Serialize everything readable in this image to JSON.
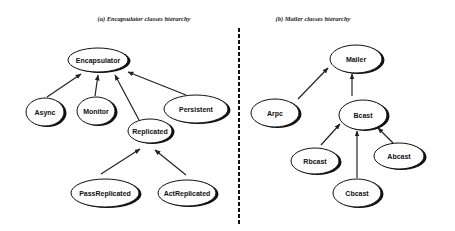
{
  "diagrams": [
    {
      "title": "(a) Encapsulator classes hierarchy",
      "title_pos": [
        144,
        21
      ],
      "nodes": [
        {
          "id": "encapsulator",
          "label": "Encapsulator",
          "cx": 98,
          "cy": 60,
          "rx": 30,
          "ry": 12
        },
        {
          "id": "async",
          "label": "Async",
          "cx": 45,
          "cy": 112,
          "rx": 19,
          "ry": 14
        },
        {
          "id": "monitor",
          "label": "Monitor",
          "cx": 96,
          "cy": 111,
          "rx": 19,
          "ry": 14
        },
        {
          "id": "persistent",
          "label": "Persistent",
          "cx": 196,
          "cy": 109,
          "rx": 32,
          "ry": 14
        },
        {
          "id": "replicated",
          "label": "Replicated",
          "cx": 150,
          "cy": 131,
          "rx": 22,
          "ry": 12
        },
        {
          "id": "passreplicated",
          "label": "PassReplicated",
          "cx": 105,
          "cy": 193,
          "rx": 34,
          "ry": 14
        },
        {
          "id": "actreplicated",
          "label": "ActReplicated",
          "cx": 187,
          "cy": 193,
          "rx": 29,
          "ry": 13
        }
      ],
      "edges": [
        {
          "from": "async",
          "to": "encapsulator",
          "x1": 47,
          "y1": 97,
          "x2": 81,
          "y2": 74
        },
        {
          "from": "monitor",
          "to": "encapsulator",
          "x1": 95,
          "y1": 96,
          "x2": 98,
          "y2": 75
        },
        {
          "from": "replicated",
          "to": "encapsulator",
          "x1": 139,
          "y1": 120,
          "x2": 115,
          "y2": 75
        },
        {
          "from": "persistent",
          "to": "encapsulator",
          "x1": 186,
          "y1": 95,
          "x2": 128,
          "y2": 72
        },
        {
          "from": "passreplicated",
          "to": "replicated",
          "x1": 101,
          "y1": 174,
          "x2": 140,
          "y2": 149
        },
        {
          "from": "actreplicated",
          "to": "replicated",
          "x1": 186,
          "y1": 175,
          "x2": 155,
          "y2": 150
        }
      ]
    },
    {
      "title": "(b) Mailer classes hierarchy",
      "title_pos": [
        313,
        21
      ],
      "nodes": [
        {
          "id": "mailer",
          "label": "Mailer",
          "cx": 356,
          "cy": 59,
          "rx": 26,
          "ry": 14
        },
        {
          "id": "arpc",
          "label": "Arpc",
          "cx": 275,
          "cy": 113,
          "rx": 24,
          "ry": 14
        },
        {
          "id": "bcast",
          "label": "Bcast",
          "cx": 363,
          "cy": 115,
          "rx": 24,
          "ry": 15
        },
        {
          "id": "rbcast",
          "label": "Rbcast",
          "cx": 315,
          "cy": 161,
          "rx": 24,
          "ry": 13
        },
        {
          "id": "abcast",
          "label": "Abcast",
          "cx": 399,
          "cy": 156,
          "rx": 25,
          "ry": 13
        },
        {
          "id": "cbcast",
          "label": "Cbcast",
          "cx": 357,
          "cy": 193,
          "rx": 24,
          "ry": 14
        }
      ],
      "edges": [
        {
          "from": "arpc",
          "to": "mailer",
          "x1": 298,
          "y1": 99,
          "x2": 328,
          "y2": 68
        },
        {
          "from": "bcast",
          "to": "mailer",
          "x1": 352,
          "y1": 96,
          "x2": 352,
          "y2": 74
        },
        {
          "from": "rbcast",
          "to": "bcast",
          "x1": 321,
          "y1": 145,
          "x2": 340,
          "y2": 124
        },
        {
          "from": "cbcast",
          "to": "bcast",
          "x1": 357,
          "y1": 178,
          "x2": 357,
          "y2": 131
        },
        {
          "from": "abcast",
          "to": "bcast",
          "x1": 393,
          "y1": 143,
          "x2": 378,
          "y2": 128
        }
      ]
    }
  ],
  "divider": {
    "x": 239,
    "y1": 28,
    "y2": 226
  }
}
